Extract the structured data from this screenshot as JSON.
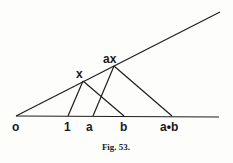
{
  "figure": {
    "caption": "Fig. 53.",
    "points": {
      "o": {
        "label": "o",
        "x": 16,
        "y": 116
      },
      "one": {
        "label": "1",
        "x": 68,
        "y": 116
      },
      "a": {
        "label": "a",
        "x": 93,
        "y": 116
      },
      "b": {
        "label": "b",
        "x": 124,
        "y": 116
      },
      "ab": {
        "label": "a•b",
        "x": 172,
        "y": 116
      },
      "x": {
        "label": "x",
        "x": 83,
        "y": 81
      },
      "ax": {
        "label": "ax",
        "x": 114,
        "y": 66
      }
    },
    "lines": [
      {
        "name": "baseline",
        "from": [
          16,
          116
        ],
        "to": [
          219,
          117
        ]
      },
      {
        "name": "upper-ray",
        "from": [
          16,
          116
        ],
        "to": [
          220,
          12
        ]
      },
      {
        "name": "one-to-x",
        "from": [
          68,
          116
        ],
        "to": [
          83,
          81
        ]
      },
      {
        "name": "x-to-b",
        "from": [
          83,
          81
        ],
        "to": [
          124,
          116
        ]
      },
      {
        "name": "a-to-ax",
        "from": [
          93,
          116
        ],
        "to": [
          114,
          66
        ]
      },
      {
        "name": "ax-to-ab",
        "from": [
          114,
          66
        ],
        "to": [
          172,
          116
        ]
      }
    ],
    "color": "#1e1e1e"
  }
}
